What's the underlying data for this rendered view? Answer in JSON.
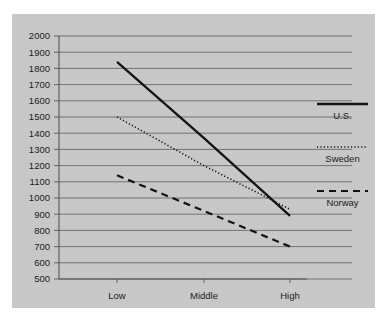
{
  "chart_data": {
    "type": "line",
    "title": "",
    "xlabel": "",
    "ylabel": "",
    "categories": [
      "Low",
      "Middle",
      "High"
    ],
    "ylim": [
      500,
      2000
    ],
    "ytick_step": 100,
    "yticks": [
      2000,
      1900,
      1800,
      1700,
      1600,
      1500,
      1400,
      1300,
      1200,
      1100,
      1000,
      900,
      800,
      700,
      600,
      500
    ],
    "grid": true,
    "legend_position": "right",
    "series": [
      {
        "name": "U.S.",
        "style": "solid",
        "values": [
          1840,
          1370,
          890
        ]
      },
      {
        "name": "Sweden",
        "style": "dotted",
        "values": [
          1500,
          1200,
          930
        ]
      },
      {
        "name": "Norway",
        "style": "dashed",
        "values": [
          1140,
          920,
          700
        ]
      }
    ]
  },
  "axis": {
    "y_labels": [
      "2000",
      "1900",
      "1800",
      "1700",
      "1600",
      "1500",
      "1400",
      "1300",
      "1200",
      "1100",
      "1000",
      "900",
      "800",
      "700",
      "600",
      "500"
    ],
    "x_labels": [
      "Low",
      "Middle",
      "High"
    ]
  },
  "legend": {
    "entries": [
      {
        "label": "U.S."
      },
      {
        "label": "Sweden"
      },
      {
        "label": "Norway"
      }
    ]
  },
  "colors": {
    "panel_background": "#c9c9c9",
    "page_background": "#ffffff",
    "line": "#141414",
    "grid": "#6a6a6a",
    "axis": "#555555",
    "text": "#1c1c1c"
  }
}
